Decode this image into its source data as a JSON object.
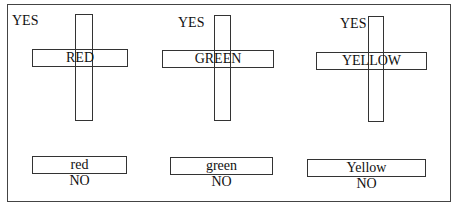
{
  "diagram": {
    "groups": [
      {
        "id": "red",
        "yes_label": "YES",
        "word_label": "RED",
        "lower_label": "red",
        "no_label": "NO"
      },
      {
        "id": "green",
        "yes_label": "YES",
        "word_label": "GREEN",
        "lower_label": "green",
        "no_label": "NO"
      },
      {
        "id": "yellow",
        "yes_label": "YES",
        "word_label": "YELLOW",
        "lower_label": "Yellow",
        "no_label": "NO"
      }
    ],
    "line_color": "#333333",
    "background": "#ffffff"
  }
}
